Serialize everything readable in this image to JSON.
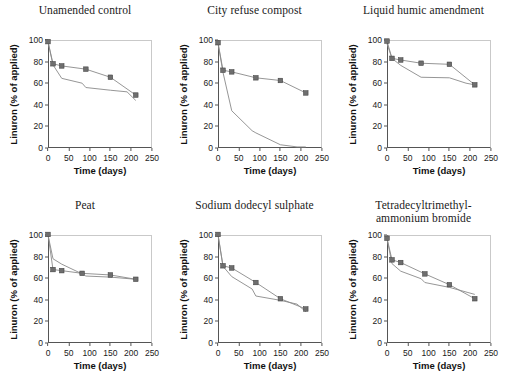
{
  "figure": {
    "axis": {
      "xlabel": "Time (days)",
      "ylabel": "Linuron (% of applied)",
      "xticks": [
        "0",
        "50",
        "100",
        "150",
        "200",
        "250"
      ],
      "yticks": [
        "0",
        "20",
        "40",
        "60",
        "80",
        "100"
      ],
      "xlim": [
        0,
        250
      ],
      "ylim": [
        0,
        100
      ],
      "grid": false,
      "legend": "none"
    },
    "colors": {
      "marker_diamond": "#3a3a3a",
      "marker_square": "#6e6e6e",
      "line": "#8a8a8a",
      "axis": "#555555",
      "text": "#1a1a1a"
    }
  },
  "chart_data": [
    {
      "type": "line",
      "title": "Unamended control",
      "title_line2": "",
      "xlabel": "Time (days)",
      "ylabel": "Linuron (% of applied)",
      "xlim": [
        0,
        250
      ],
      "ylim": [
        0,
        100
      ],
      "grid": false,
      "series": [
        {
          "name": "diamond",
          "marker": "diamond",
          "x": [
            0,
            12,
            33,
            82,
            91,
            150,
            190,
            211
          ],
          "values": [
            98,
            77,
            64.5,
            60,
            56,
            53.5,
            52,
            44
          ]
        },
        {
          "name": "square",
          "marker": "square",
          "x": [
            0,
            12,
            33,
            91,
            150,
            211
          ],
          "values": [
            98.5,
            78,
            76,
            73,
            65.5,
            49
          ]
        }
      ]
    },
    {
      "type": "line",
      "title": "City refuse compost",
      "title_line2": "",
      "xlabel": "Time (days)",
      "ylabel": "Linuron (% of applied)",
      "xlim": [
        0,
        250
      ],
      "ylim": [
        0,
        100
      ],
      "grid": false,
      "series": [
        {
          "name": "diamond",
          "marker": "diamond",
          "x": [
            0,
            12,
            33,
            82,
            91,
            150,
            190,
            211
          ],
          "values": [
            97,
            70,
            34.5,
            16,
            14,
            3,
            1,
            1
          ]
        },
        {
          "name": "square",
          "marker": "square",
          "x": [
            0,
            12,
            33,
            91,
            150,
            211
          ],
          "values": [
            97.5,
            72,
            70.5,
            65,
            62.5,
            51
          ]
        }
      ]
    },
    {
      "type": "line",
      "title": "Liquid humic amendment",
      "title_line2": "",
      "xlabel": "Time (days)",
      "ylabel": "Linuron (% of applied)",
      "xlim": [
        0,
        250
      ],
      "ylim": [
        0,
        100
      ],
      "grid": false,
      "series": [
        {
          "name": "diamond",
          "marker": "diamond",
          "x": [
            0,
            12,
            33,
            82,
            150,
            190,
            211
          ],
          "values": [
            96.5,
            83,
            76.5,
            65.5,
            65,
            60,
            58.5
          ]
        },
        {
          "name": "square",
          "marker": "square",
          "x": [
            0,
            12,
            33,
            82,
            150,
            211
          ],
          "values": [
            99,
            83,
            81.5,
            78.5,
            77.5,
            58.5
          ]
        }
      ]
    },
    {
      "type": "line",
      "title": "Peat",
      "title_line2": "",
      "xlabel": "Time (days)",
      "ylabel": "Linuron (% of applied)",
      "xlim": [
        0,
        250
      ],
      "ylim": [
        0,
        100
      ],
      "grid": false,
      "series": [
        {
          "name": "diamond",
          "marker": "diamond",
          "x": [
            0,
            12,
            33,
            82,
            91,
            150,
            211
          ],
          "values": [
            100,
            78,
            73,
            64,
            62,
            61,
            59
          ]
        },
        {
          "name": "square",
          "marker": "square",
          "x": [
            0,
            12,
            33,
            82,
            150,
            211
          ],
          "values": [
            100.5,
            68,
            67,
            64.5,
            63,
            59
          ]
        }
      ]
    },
    {
      "type": "line",
      "title": "Sodium dodecyl sulphate",
      "title_line2": "",
      "xlabel": "Time (days)",
      "ylabel": "Linuron (% of applied)",
      "xlim": [
        0,
        250
      ],
      "ylim": [
        0,
        100
      ],
      "grid": false,
      "series": [
        {
          "name": "diamond",
          "marker": "diamond",
          "x": [
            0,
            12,
            33,
            82,
            91,
            150,
            190,
            211
          ],
          "values": [
            100,
            71,
            61.5,
            50,
            43.5,
            39.5,
            36,
            29
          ]
        },
        {
          "name": "square",
          "marker": "square",
          "x": [
            0,
            12,
            33,
            91,
            150,
            211
          ],
          "values": [
            100.5,
            71.5,
            69.5,
            56,
            41,
            31.5
          ]
        }
      ]
    },
    {
      "type": "line",
      "title": "Tetradecyltrimethyl-",
      "title_line2": "ammonium bromide",
      "xlabel": "Time (days)",
      "ylabel": "Linuron (% of applied)",
      "xlim": [
        0,
        250
      ],
      "ylim": [
        0,
        100
      ],
      "grid": false,
      "series": [
        {
          "name": "diamond",
          "marker": "diamond",
          "x": [
            0,
            12,
            33,
            82,
            91,
            150,
            211
          ],
          "values": [
            96.5,
            73.5,
            66.5,
            59.5,
            56,
            51.5,
            45
          ]
        },
        {
          "name": "square",
          "marker": "square",
          "x": [
            0,
            12,
            33,
            91,
            150,
            211
          ],
          "values": [
            97,
            77,
            74.5,
            64,
            54,
            41
          ]
        }
      ]
    }
  ]
}
